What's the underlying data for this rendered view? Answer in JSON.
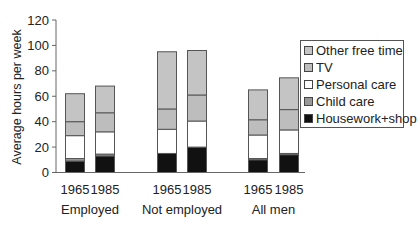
{
  "chart_data": {
    "type": "bar",
    "stacked": true,
    "title": "",
    "xlabel": "",
    "ylabel": "Average hours per week",
    "ylim": [
      0,
      120
    ],
    "yticks": [
      0,
      20,
      40,
      60,
      80,
      100,
      120
    ],
    "grid": false,
    "legend_position": "right",
    "groups": [
      "Employed",
      "Not employed",
      "All men"
    ],
    "categories": [
      "1965",
      "1985",
      "1965",
      "1985",
      "1965",
      "1985"
    ],
    "category_groups": [
      "Employed",
      "Employed",
      "Not employed",
      "Not employed",
      "All men",
      "All men"
    ],
    "series": [
      {
        "name": "Housework+shop",
        "color": "#111111",
        "values": [
          9,
          13,
          15,
          20,
          10,
          14
        ]
      },
      {
        "name": "Child care",
        "color": "#999999",
        "values": [
          2,
          1.5,
          0,
          0,
          1,
          1
        ]
      },
      {
        "name": "Personal care",
        "color": "#ffffff",
        "values": [
          18,
          17.5,
          19,
          20.5,
          18.5,
          18.5
        ]
      },
      {
        "name": "TV",
        "color": "#bdbdbd",
        "values": [
          11,
          15,
          16,
          20.5,
          12,
          16
        ]
      },
      {
        "name": "Other free time",
        "color": "#c4c4c4",
        "values": [
          22,
          21,
          45,
          35,
          23.5,
          25
        ]
      }
    ],
    "totals": [
      62,
      68,
      95,
      96,
      65,
      74.5
    ]
  },
  "legend": {
    "items": [
      {
        "label": "Other free time",
        "color": "#c4c4c4"
      },
      {
        "label": "TV",
        "color": "#bdbdbd"
      },
      {
        "label": "Personal care",
        "color": "#ffffff"
      },
      {
        "label": "Child care",
        "color": "#999999"
      },
      {
        "label": "Housework+shop",
        "color": "#111111"
      }
    ]
  },
  "axis": {
    "ylabel": "Average hours per week",
    "yticks": [
      "0",
      "20",
      "40",
      "60",
      "80",
      "100",
      "120"
    ],
    "bar_labels": [
      "1965",
      "1985",
      "1965",
      "1985",
      "1965",
      "1985"
    ],
    "group_labels": [
      "Employed",
      "Not employed",
      "All men"
    ]
  }
}
